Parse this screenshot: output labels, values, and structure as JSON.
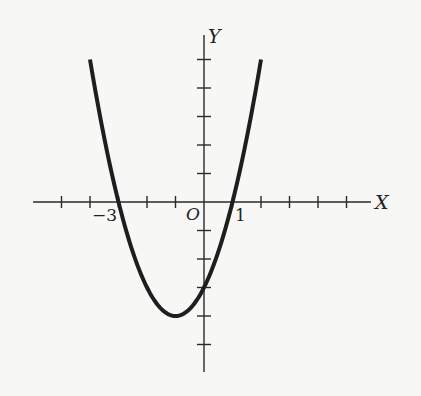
{
  "chart_data": {
    "type": "line",
    "title": "",
    "equation": "y = x^2 + 2x - 3",
    "xlabel": "X",
    "ylabel": "Y",
    "origin_label": "O",
    "tick_labels": [
      {
        "axis": "x",
        "value": -3,
        "text": "−3"
      },
      {
        "axis": "x",
        "value": 1,
        "text": "1"
      }
    ],
    "x_ticks": [
      -5,
      -4,
      -3,
      -2,
      -1,
      1,
      2,
      3,
      4,
      5
    ],
    "y_ticks": [
      -5,
      -4,
      -3,
      -2,
      -1,
      1,
      2,
      3,
      4,
      5
    ],
    "xlim": [
      -6,
      5.8
    ],
    "ylim": [
      -6,
      5.9
    ],
    "grid": false,
    "legend": null,
    "series": [
      {
        "name": "parabola",
        "x": [
          -4,
          -3.5,
          -3,
          -2.5,
          -2,
          -1.5,
          -1,
          -0.5,
          0,
          0.5,
          1,
          1.5,
          2
        ],
        "y": [
          5,
          2.25,
          0,
          -1.75,
          -3,
          -3.75,
          -4,
          -3.75,
          -3,
          -1.75,
          0,
          2.25,
          5
        ]
      }
    ],
    "key_points": {
      "vertex": [
        -1,
        -4
      ],
      "x_intercepts": [
        -3,
        1
      ],
      "y_intercept": [
        0,
        -3
      ]
    }
  },
  "labels": {
    "x_axis": "X",
    "y_axis": "Y",
    "origin": "O",
    "tick_neg3": "−3",
    "tick_1": "1"
  }
}
